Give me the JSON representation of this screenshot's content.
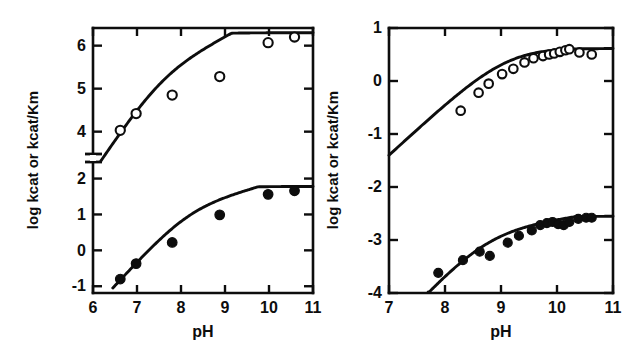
{
  "figure": {
    "background_color": "#ffffff",
    "ink_color": "#0d0d0d",
    "panel_count": 2
  },
  "chart_data": [
    {
      "id": "panel-left",
      "type": "scatter",
      "title": "",
      "xlabel": "pH",
      "ylabel": "log kcat or kcat/Km",
      "xlim": [
        6,
        11
      ],
      "xticks": [
        6,
        7,
        8,
        9,
        10,
        11
      ],
      "xticklabels": [
        "6",
        "7",
        "8",
        "9",
        "10",
        "11"
      ],
      "yticks": [
        -1,
        0,
        1,
        2,
        4,
        5,
        6
      ],
      "yticklabels": [
        "-1",
        "0",
        "1",
        "2",
        "4",
        "5",
        "6"
      ],
      "y_axis_broken": true,
      "y_break_between": [
        2,
        4
      ],
      "grid": false,
      "legend": "none",
      "series": [
        {
          "name": "log kcat/Km",
          "marker": "open-circle",
          "x": [
            6.62,
            6.98,
            7.8,
            8.88,
            9.98,
            10.58
          ],
          "y": [
            4.03,
            4.42,
            4.85,
            5.28,
            6.07,
            6.2
          ],
          "fit_curve": {
            "x_start": 6.18,
            "x_end": 11.0,
            "y_start": 3.32,
            "plateau": 6.3,
            "pKa": 7.55
          }
        },
        {
          "name": "log kcat",
          "marker": "filled-circle",
          "x": [
            6.62,
            6.98,
            7.8,
            8.88,
            9.98,
            10.58
          ],
          "y": [
            -0.8,
            -0.37,
            0.22,
            0.99,
            1.56,
            1.66
          ],
          "fit_curve": {
            "x_start": 6.45,
            "x_end": 11.0,
            "y_start": -1.05,
            "plateau": 1.78,
            "pKa": 8.15
          }
        }
      ]
    },
    {
      "id": "panel-right",
      "type": "scatter",
      "title": "",
      "xlabel": "pH",
      "ylabel": "log kcat or kcat/Km",
      "xlim": [
        7,
        11
      ],
      "xticks": [
        7,
        8,
        9,
        10,
        11
      ],
      "xticklabels": [
        "7",
        "8",
        "9",
        "10",
        "11"
      ],
      "ylim": [
        -4,
        1
      ],
      "yticks": [
        -4,
        -3,
        -2,
        -1,
        0,
        1
      ],
      "yticklabels": [
        "-4",
        "-3",
        "-2",
        "-1",
        "0",
        "1"
      ],
      "y_axis_broken": false,
      "grid": false,
      "legend": "none",
      "series": [
        {
          "name": "log kcat/Km",
          "marker": "open-circle",
          "x": [
            8.28,
            8.6,
            8.78,
            9.02,
            9.22,
            9.42,
            9.58,
            9.75,
            9.86,
            9.95,
            10.05,
            10.15,
            10.22,
            10.4,
            10.62
          ],
          "y": [
            -0.56,
            -0.22,
            -0.05,
            0.13,
            0.23,
            0.35,
            0.43,
            0.47,
            0.5,
            0.52,
            0.55,
            0.58,
            0.6,
            0.54,
            0.5
          ],
          "fit_curve": {
            "x_start": 7.0,
            "x_end": 11.0,
            "y_start": -1.4,
            "plateau": 0.62,
            "pKa": 9.12
          }
        },
        {
          "name": "log kcat",
          "marker": "filled-circle",
          "x": [
            7.88,
            8.32,
            8.62,
            8.8,
            9.12,
            9.32,
            9.55,
            9.7,
            9.82,
            9.92,
            10.02,
            10.12,
            10.22,
            10.38,
            10.52,
            10.62
          ],
          "y": [
            -3.62,
            -3.38,
            -3.22,
            -3.3,
            -3.05,
            -2.92,
            -2.82,
            -2.72,
            -2.68,
            -2.66,
            -2.7,
            -2.72,
            -2.66,
            -2.6,
            -2.58,
            -2.58
          ],
          "fit_curve": {
            "x_start": 7.7,
            "x_end": 11.0,
            "y_start": -4.0,
            "plateau": -2.55,
            "pKa": 8.72
          }
        }
      ]
    }
  ]
}
